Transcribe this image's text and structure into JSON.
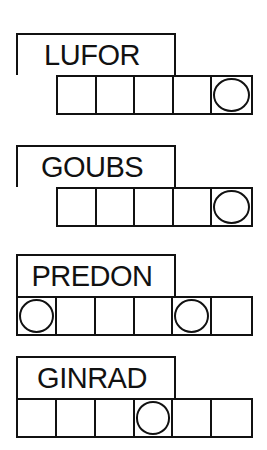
{
  "puzzles": [
    {
      "scrambled": "LUFOR",
      "num_cells": 5,
      "circled_cells": [
        5
      ],
      "top": 33,
      "cells_left": 56
    },
    {
      "scrambled": "GOUBS",
      "num_cells": 5,
      "circled_cells": [
        5
      ],
      "top": 145,
      "cells_left": 56
    },
    {
      "scrambled": "PREDON",
      "num_cells": 6,
      "circled_cells": [
        1,
        5
      ],
      "top": 254,
      "cells_left": 16
    },
    {
      "scrambled": "GINRAD",
      "num_cells": 6,
      "circled_cells": [
        4
      ],
      "top": 356,
      "cells_left": 16
    }
  ],
  "colors": {
    "ink": "#111111",
    "background": "#ffffff"
  }
}
